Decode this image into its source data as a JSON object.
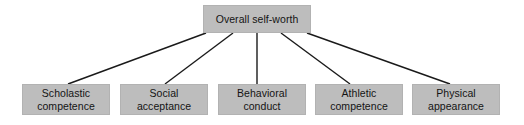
{
  "diagram": {
    "type": "hierarchy-tree",
    "colors": {
      "box_fill": "#bdbdbd",
      "box_border": "#b2b2b2",
      "text": "#141414",
      "connector": "#1a1a1a",
      "background": "#ffffff"
    },
    "root": {
      "label": "Overall self-worth",
      "x": 203,
      "y": 5,
      "width": 108,
      "height": 28
    },
    "children": [
      {
        "label": "Scholastic\ncompetence",
        "line1": "Scholastic",
        "line2": "competence",
        "x": 22,
        "y": 84,
        "width": 88,
        "height": 31
      },
      {
        "label": "Social\nacceptance",
        "line1": "Social",
        "line2": "acceptance",
        "x": 120,
        "y": 84,
        "width": 88,
        "height": 31
      },
      {
        "label": "Behavioral\nconduct",
        "line1": "Behavioral",
        "line2": "conduct",
        "x": 218,
        "y": 84,
        "width": 88,
        "height": 31
      },
      {
        "label": "Athletic\ncompetence",
        "line1": "Athletic",
        "line2": "competence",
        "x": 315,
        "y": 84,
        "width": 88,
        "height": 31
      },
      {
        "label": "Physical\nappearance",
        "line1": "Physical",
        "line2": "appearance",
        "x": 412,
        "y": 84,
        "width": 88,
        "height": 31
      }
    ],
    "connectors": [
      {
        "x1": 206,
        "y1": 33,
        "x2": 68,
        "y2": 84
      },
      {
        "x1": 233,
        "y1": 33,
        "x2": 165,
        "y2": 84
      },
      {
        "x1": 257,
        "y1": 33,
        "x2": 257,
        "y2": 84
      },
      {
        "x1": 281,
        "y1": 33,
        "x2": 350,
        "y2": 84
      },
      {
        "x1": 307,
        "y1": 33,
        "x2": 450,
        "y2": 84
      }
    ]
  }
}
